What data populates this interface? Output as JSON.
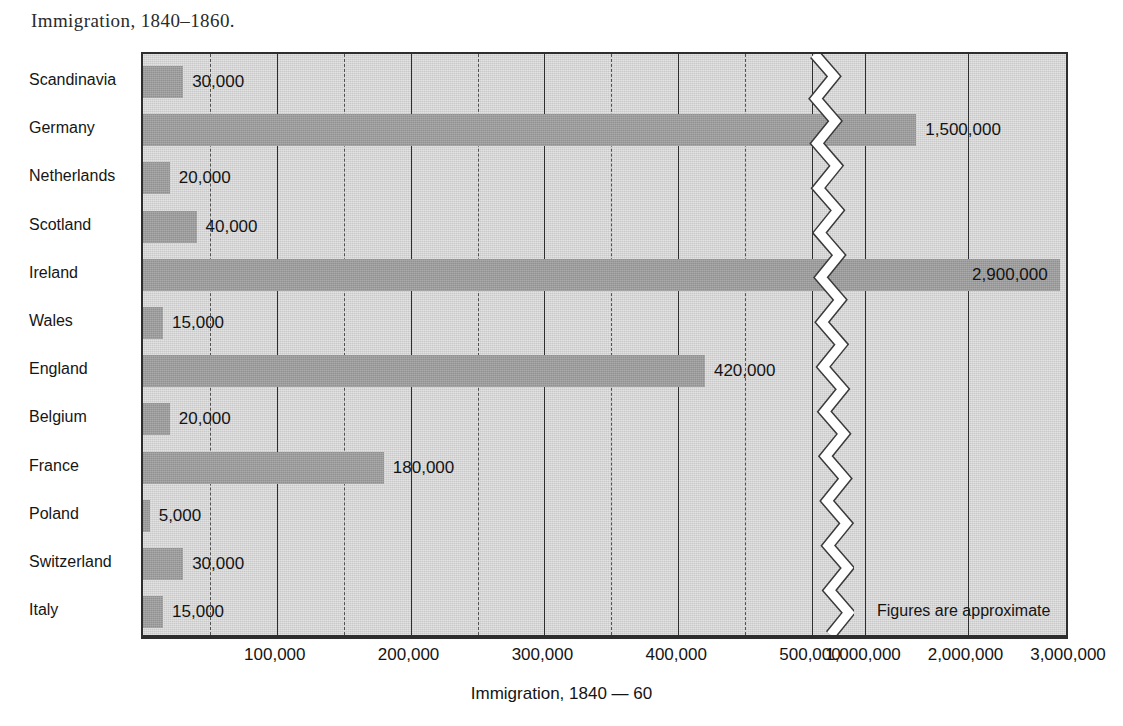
{
  "title": "Immigration, 1840–1860.",
  "note": "Figures are approximate",
  "axis_title": "Immigration, 1840 — 60",
  "colors": {
    "bar_fill": "#9c9c9c",
    "plot_background": "#c9c9c9",
    "frame": "#2e2e2e",
    "text": "#141414",
    "break_line": "#ffffff"
  },
  "chart_data": {
    "type": "bar",
    "orientation": "horizontal",
    "title": "Immigration, 1840–1860.",
    "xlabel": "Immigration, 1840 — 60",
    "ylabel": "",
    "grid": true,
    "legend": "none",
    "axis_break": {
      "present": true,
      "after": 500000,
      "resumes_at": 1000000,
      "style": "zigzag"
    },
    "xlim": [
      0,
      3000000
    ],
    "tick_labels": [
      "100,000",
      "200,000",
      "300,000",
      "400,000",
      "500,000",
      "1,000,000",
      "2,000,000",
      "3,000,000"
    ],
    "tick_values": [
      100000,
      200000,
      300000,
      400000,
      500000,
      1000000,
      2000000,
      3000000
    ],
    "minor_tick_values": [
      50000,
      150000,
      250000,
      350000,
      450000
    ],
    "categories": [
      "Scandinavia",
      "Germany",
      "Netherlands",
      "Scotland",
      "Ireland",
      "Wales",
      "England",
      "Belgium",
      "France",
      "Poland",
      "Switzerland",
      "Italy"
    ],
    "values": [
      30000,
      1500000,
      20000,
      40000,
      2900000,
      15000,
      420000,
      20000,
      180000,
      5000,
      30000,
      15000
    ],
    "value_labels": [
      "30,000",
      "1,500,000",
      "20,000",
      "40,000",
      "2,900,000",
      "15,000",
      "420,000",
      "20,000",
      "180,000",
      "5,000",
      "30,000",
      "15,000"
    ],
    "label_placement": [
      "outside",
      "outside",
      "outside",
      "outside",
      "inside",
      "outside",
      "outside",
      "outside",
      "outside",
      "outside",
      "outside",
      "outside"
    ]
  }
}
